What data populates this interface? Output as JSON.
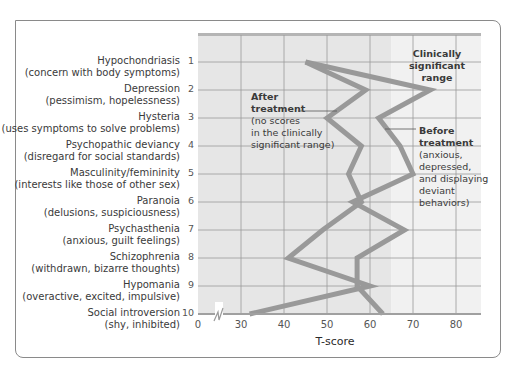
{
  "chart_data": {
    "type": "line",
    "orientation": "horizontal-profile",
    "title": "",
    "xlabel": "T-score",
    "ylabel": "",
    "xlim": [
      0,
      85
    ],
    "x_axis_break": true,
    "x_ticks": [
      "0",
      "30",
      "40",
      "50",
      "60",
      "70",
      "80"
    ],
    "grid": true,
    "shaded_region": {
      "label": "Clinically significant range",
      "from": 65,
      "to": 85
    },
    "categories": [
      {
        "num": "1",
        "name": "Hypochondriasis",
        "desc": "(concern with body symptoms)"
      },
      {
        "num": "2",
        "name": "Depression",
        "desc": "(pessimism, hopelessness)"
      },
      {
        "num": "3",
        "name": "Hysteria",
        "desc": "(uses symptoms to solve problems)"
      },
      {
        "num": "4",
        "name": "Psychopathic deviancy",
        "desc": "(disregard for social standards)"
      },
      {
        "num": "5",
        "name": "Masculinity/femininity",
        "desc": "(interests like those of other sex)"
      },
      {
        "num": "6",
        "name": "Paranoia",
        "desc": "(delusions, suspiciousness)"
      },
      {
        "num": "7",
        "name": "Psychasthenia",
        "desc": "(anxious, guilt feelings)"
      },
      {
        "num": "8",
        "name": "Schizophrenia",
        "desc": "(withdrawn, bizarre thoughts)"
      },
      {
        "num": "9",
        "name": "Hypomania",
        "desc": "(overactive, excited, impulsive)"
      },
      {
        "num": "10",
        "name": "Social introversion",
        "desc": "(shy, inhibited)"
      }
    ],
    "series": [
      {
        "name": "Before treatment",
        "values": [
          45,
          74,
          62,
          67,
          70,
          56,
          68,
          57,
          57,
          63
        ]
      },
      {
        "name": "After treatment",
        "values": [
          45,
          59,
          50,
          58,
          55,
          58,
          49,
          41,
          60,
          32
        ]
      }
    ],
    "annotations": [
      {
        "title": "After treatment",
        "text": [
          "(no scores",
          "in the clinically",
          "significant range)"
        ]
      },
      {
        "title": "Before treatment",
        "text": [
          "(anxious,",
          "depressed,",
          "and displaying",
          "deviant",
          "behaviors)"
        ]
      },
      {
        "title": "Clinically significant range",
        "text": [
          "Clinically",
          "significant",
          "range"
        ]
      }
    ]
  },
  "labels": {
    "xlabel": "T-score",
    "clinical": [
      "Clinically",
      "significant",
      "range"
    ],
    "after_title": [
      "After",
      "treatment"
    ],
    "after_text": [
      "(no scores",
      "in the clinically",
      "significant range)"
    ],
    "before_title": [
      "Before",
      "treatment"
    ],
    "before_text": [
      "(anxious,",
      "depressed,",
      "and displaying",
      "deviant",
      "behaviors)"
    ]
  },
  "colors": {
    "plot_bg": "#e6e6e6",
    "clinical_bg": "#f1f1f1",
    "grid": "#9a9a9a",
    "line": "#999999",
    "frame": "#8a8a8a",
    "text": "#3a3a3a"
  }
}
